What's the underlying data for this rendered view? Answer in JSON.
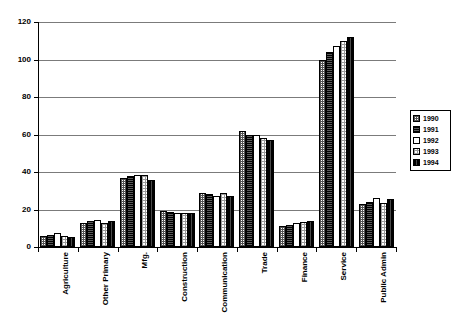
{
  "chart_data": {
    "type": "bar",
    "title": "",
    "subtitle": "",
    "xlabel": "",
    "ylabel": "",
    "ylim": [
      0,
      120
    ],
    "yticks": [
      0,
      20,
      40,
      60,
      80,
      100,
      120
    ],
    "grid": true,
    "legend_position": "right",
    "categories": [
      "Agriculture",
      "Other Primary",
      "Mfg.",
      "Construction",
      "Communication",
      "Trade",
      "Finance",
      "Service",
      "Public Admin"
    ],
    "series": [
      {
        "name": "1990",
        "values": [
          6,
          13,
          37,
          19,
          29,
          62,
          11,
          100,
          23
        ]
      },
      {
        "name": "1991",
        "values": [
          6.5,
          14,
          38,
          18.5,
          28.5,
          59.5,
          12,
          104,
          24
        ]
      },
      {
        "name": "1992",
        "values": [
          7.5,
          14.5,
          38.5,
          18,
          27,
          60,
          13,
          107,
          26
        ]
      },
      {
        "name": "1993",
        "values": [
          6,
          13,
          38.5,
          18,
          29,
          58,
          13.5,
          110,
          23.5
        ]
      },
      {
        "name": "1994",
        "values": [
          5.5,
          14,
          36,
          18,
          27,
          57,
          14,
          112,
          25.5
        ]
      }
    ]
  },
  "legend": {
    "entries": [
      {
        "label": "1990",
        "pattern": "checker-medium"
      },
      {
        "label": "1991",
        "pattern": "dark-dense"
      },
      {
        "label": "1992",
        "pattern": "blank-white"
      },
      {
        "label": "1993",
        "pattern": "dotted-light"
      },
      {
        "label": "1994",
        "pattern": "dark-solid"
      }
    ]
  },
  "axes": {
    "y_tick_labels": [
      "0",
      "20",
      "40",
      "60",
      "80",
      "100",
      "120"
    ],
    "x_tick_labels": [
      "Agriculture",
      "Other Primary",
      "Mfg.",
      "Construction",
      "Communication",
      "Trade",
      "Finance",
      "Service",
      "Public Admin"
    ]
  },
  "colors": {
    "axis": "#000000",
    "gridline": "#7b7b7b",
    "background": "#ffffff",
    "series_1990": "#555555",
    "series_1991": "#2a2a2a",
    "series_1992": "#ffffff",
    "series_1993": "#9a9a9a",
    "series_1994": "#1c1c1c"
  }
}
